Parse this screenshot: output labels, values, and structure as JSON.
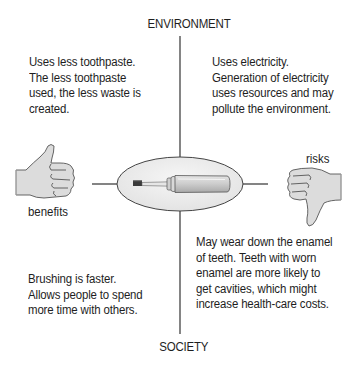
{
  "diagram": {
    "axes": {
      "top_label": "ENVIRONMENT",
      "bottom_label": "SOCIETY"
    },
    "center": {
      "icon": "electric-toothbrush-icon"
    },
    "sides": {
      "left": {
        "label": "benefits",
        "icon": "thumbs-up-icon"
      },
      "right": {
        "label": "risks",
        "icon": "thumbs-down-icon"
      }
    },
    "quadrants": {
      "environment_benefit": "Uses less toothpaste.\nThe less toothpaste\nused, the less waste is\ncreated.",
      "environment_risk": "Uses electricity.\nGeneration of electricity\nuses resources and may\npollute the environment.",
      "society_benefit": "Brushing is faster.\nAllows people to spend\nmore time with others.",
      "society_risk": "May wear down the enamel\nof teeth. Teeth with worn\nenamel are more likely to\nget cavities, which might\nincrease health-care costs."
    },
    "colors": {
      "line": "#333333",
      "hand_fill": "#d9d9d9",
      "ellipse_fill": "#ededed",
      "text": "#1e1e1e"
    }
  }
}
